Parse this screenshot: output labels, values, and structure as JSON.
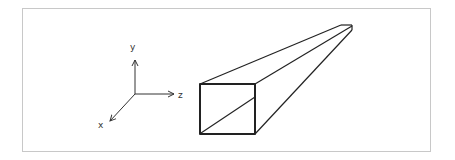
{
  "diagram": {
    "axes": {
      "x_label": "x",
      "y_label": "y",
      "z_label": "z"
    },
    "figure": "rectangular beam in perspective with diagonal on front face",
    "colors": {
      "stroke": "#222222",
      "frame": "#c8c8c8",
      "background": "#ffffff"
    }
  }
}
